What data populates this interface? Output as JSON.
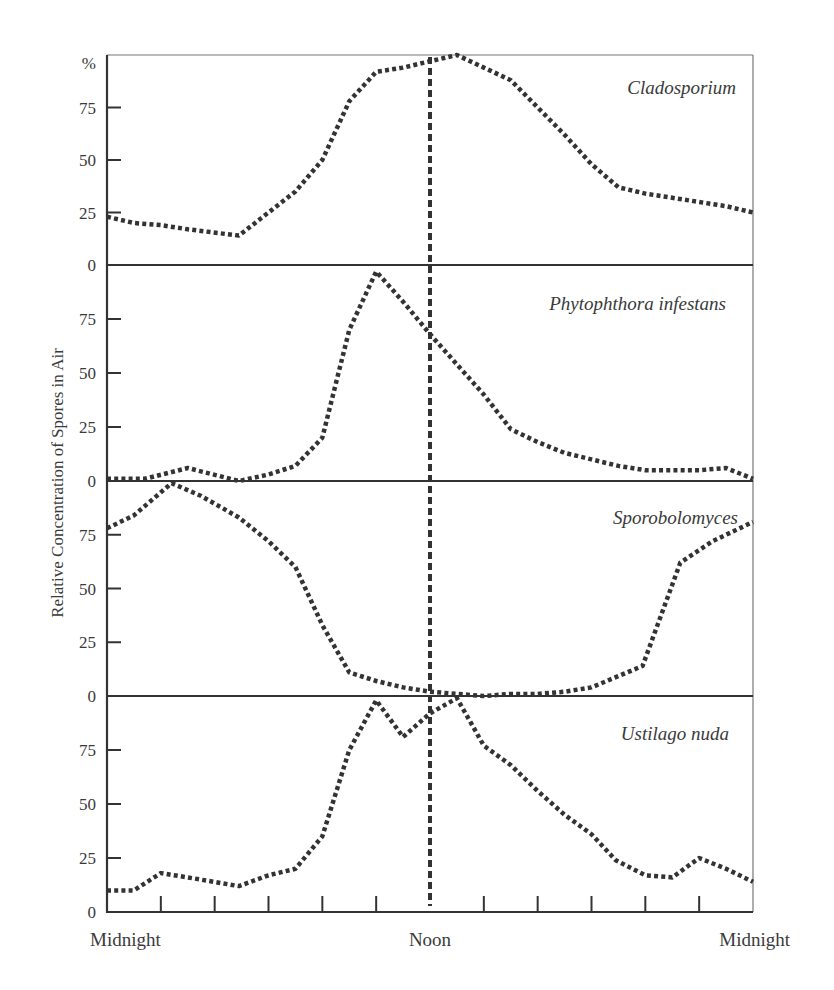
{
  "chart_data": {
    "type": "line",
    "title": "",
    "ylabel": "Relative Concentration of Spores in Air",
    "y_unit_label": "%",
    "xlabel": "",
    "x_tick_labels": [
      {
        "hour": 0,
        "label": "Midnight"
      },
      {
        "hour": 12,
        "label": "Noon"
      },
      {
        "hour": 24,
        "label": "Midnight"
      }
    ],
    "x_range_hours": [
      0,
      24
    ],
    "x_minor_tick_step_hours": 2,
    "ylim": [
      0,
      100
    ],
    "y_ticks": [
      0,
      25,
      50,
      75
    ],
    "reference_line": {
      "hour": 12,
      "style": "dashed",
      "label": "Noon"
    },
    "grid": false,
    "legend": "none (panel titles in italics, top-right of each panel)",
    "series": [
      {
        "name": "Cladosporium",
        "x": [
          0,
          1,
          2,
          3,
          4.9,
          6,
          7,
          8,
          9,
          10,
          11,
          12,
          13,
          14,
          15,
          16,
          17,
          18,
          19,
          20,
          21,
          22,
          23,
          24
        ],
        "y": [
          23,
          20,
          19,
          17,
          14,
          25,
          35,
          50,
          78,
          92,
          94,
          97,
          100,
          94,
          88,
          75,
          62,
          48,
          37,
          34,
          32,
          30,
          28,
          25
        ]
      },
      {
        "name": "Phytophthora infestans",
        "x": [
          0,
          1.4,
          3,
          4.9,
          6,
          7,
          8,
          9,
          10,
          11,
          12,
          13,
          14,
          15,
          16,
          17,
          18,
          19,
          20,
          21,
          22,
          23,
          24
        ],
        "y": [
          1,
          1,
          6,
          0,
          3,
          7,
          20,
          70,
          97,
          83,
          68,
          54,
          40,
          24,
          18,
          13,
          10,
          7,
          5,
          5,
          5,
          6,
          1
        ]
      },
      {
        "name": "Sporobolomyces",
        "x": [
          0,
          1,
          2.4,
          3.5,
          4.9,
          6,
          7,
          8,
          9,
          10,
          11,
          12,
          13,
          14,
          15,
          16,
          17,
          18,
          19.9,
          21.3,
          22.5,
          24
        ],
        "y": [
          78,
          84,
          99,
          93,
          83,
          72,
          60,
          33,
          11,
          7,
          4,
          2,
          1,
          0,
          1,
          1,
          2,
          4,
          14,
          62,
          72,
          81
        ]
      },
      {
        "name": "Ustilago nuda",
        "x": [
          0,
          1,
          2,
          3,
          4.9,
          6,
          7,
          8,
          9,
          10,
          11,
          12,
          13,
          14,
          15,
          16,
          17,
          18,
          18.9,
          20,
          21,
          22,
          23,
          24
        ],
        "y": [
          10,
          10,
          18,
          16,
          12,
          17,
          20,
          35,
          75,
          98,
          81,
          92,
          99,
          77,
          68,
          56,
          45,
          36,
          24,
          17,
          16,
          25,
          20,
          14
        ]
      }
    ]
  },
  "axis": {
    "y_unit_label": "%",
    "y_title": "Relative Concentration of Spores in Air",
    "y_tick_labels": [
      "0",
      "25",
      "50",
      "75"
    ],
    "x_labels": [
      "Midnight",
      "Noon",
      "Midnight"
    ]
  },
  "colors": {
    "ink": "#333333",
    "text": "#3a3a3a",
    "frame": "#555555",
    "background": "#ffffff"
  }
}
